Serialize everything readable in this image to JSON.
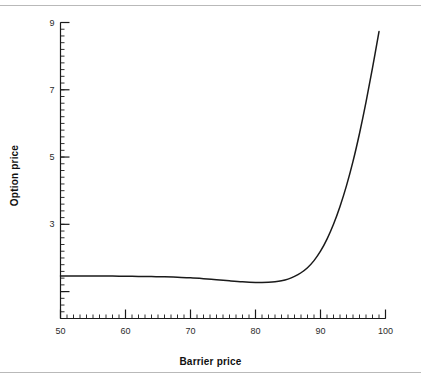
{
  "figure": {
    "background": "#ffffff",
    "rule_color": "#b9b9b9",
    "has_top_rule": true,
    "has_bottom_rule": true
  },
  "chart_data": {
    "type": "line",
    "title": "",
    "xlabel": "Barrier price",
    "ylabel": "Option price",
    "xlim": [
      50,
      100
    ],
    "ylim": [
      0.2,
      9
    ],
    "grid": false,
    "legend": null,
    "line_color": "#1a1a1a",
    "xticks": [
      50,
      60,
      70,
      80,
      90,
      100
    ],
    "xticklabels": [
      "50",
      "60",
      "70",
      "80",
      "90",
      "100"
    ],
    "xminor_step": 1,
    "yticks": [
      3,
      5,
      7,
      9
    ],
    "yticklabels": [
      "3",
      "5",
      "7",
      "9"
    ],
    "yminor_step": 0.2,
    "series": [
      {
        "name": "Option price vs barrier price",
        "x": [
          50,
          52,
          54,
          56,
          58,
          60,
          62,
          64,
          66,
          68,
          70,
          72,
          74,
          76,
          78,
          80,
          81,
          82,
          83,
          84,
          85,
          86,
          87,
          88,
          89,
          90,
          91,
          92,
          93,
          94,
          95,
          96,
          97,
          98,
          99
        ],
        "y": [
          1.46,
          1.46,
          1.46,
          1.46,
          1.46,
          1.455,
          1.45,
          1.445,
          1.44,
          1.425,
          1.41,
          1.385,
          1.355,
          1.32,
          1.29,
          1.27,
          1.27,
          1.275,
          1.29,
          1.32,
          1.37,
          1.45,
          1.56,
          1.71,
          1.92,
          2.2,
          2.56,
          3.0,
          3.53,
          4.15,
          4.87,
          5.7,
          6.63,
          7.65,
          8.73
        ]
      }
    ],
    "annotations": []
  }
}
